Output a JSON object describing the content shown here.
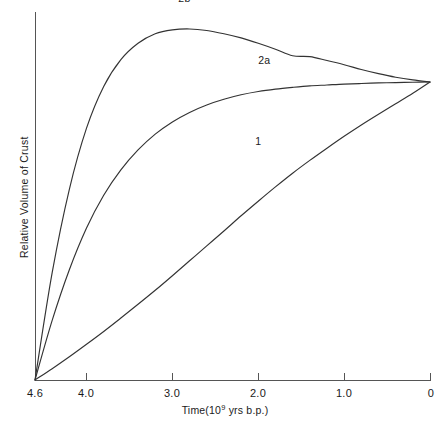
{
  "chart_data": {
    "type": "line",
    "title": "",
    "xlabel": "Time(10⁹ yrs b.p.)",
    "xlabel_parts": {
      "prefix": "Time(10",
      "exponent": "9",
      "suffix": " yrs b.p.)"
    },
    "ylabel": "Relative Volume of Crust",
    "xlim": [
      4.6,
      0.0
    ],
    "ylim": [
      0,
      1.05
    ],
    "x_axis_reversed": true,
    "xticks": [
      4.6,
      4.0,
      3.0,
      2.0,
      1.0,
      0
    ],
    "xticklabels": [
      "4.6",
      "4.0",
      "3.0",
      "2.0",
      "1.0",
      "0"
    ],
    "yticks": [],
    "yticklabels": [],
    "grid": false,
    "legend": "inline-curve-labels",
    "series": [
      {
        "name": "1",
        "label": "1",
        "label_x": 2.0,
        "label_y": 0.79,
        "x": [
          4.6,
          4.4,
          4.2,
          4.0,
          3.8,
          3.6,
          3.4,
          3.2,
          3.0,
          2.8,
          2.6,
          2.4,
          2.2,
          2.0,
          1.8,
          1.6,
          1.4,
          1.2,
          1.0,
          0.8,
          0.6,
          0.4,
          0.2,
          0.0
        ],
        "y": [
          0.0,
          0.038,
          0.078,
          0.12,
          0.163,
          0.208,
          0.254,
          0.301,
          0.35,
          0.4,
          0.45,
          0.5,
          0.551,
          0.6,
          0.648,
          0.694,
          0.737,
          0.778,
          0.818,
          0.856,
          0.892,
          0.927,
          0.962,
          1.0
        ]
      },
      {
        "name": "2a",
        "label": "2a",
        "label_x": 1.93,
        "label_y": 1.06,
        "x": [
          4.6,
          4.4,
          4.2,
          4.0,
          3.8,
          3.6,
          3.4,
          3.2,
          3.0,
          2.8,
          2.6,
          2.4,
          2.2,
          2.0,
          1.8,
          1.6,
          1.4,
          1.2,
          1.0,
          0.8,
          0.6,
          0.4,
          0.2,
          0.0
        ],
        "y": [
          0.0,
          0.2,
          0.37,
          0.51,
          0.62,
          0.705,
          0.772,
          0.825,
          0.866,
          0.898,
          0.923,
          0.942,
          0.957,
          0.968,
          0.976,
          0.982,
          0.987,
          0.99,
          0.993,
          0.995,
          0.997,
          0.998,
          0.999,
          1.0
        ]
      },
      {
        "name": "2b",
        "label": "2b",
        "label_x": 2.86,
        "label_y": 1.27,
        "x": [
          4.6,
          4.4,
          4.2,
          4.0,
          3.8,
          3.6,
          3.4,
          3.2,
          3.0,
          2.8,
          2.6,
          2.4,
          2.2,
          2.0,
          1.8,
          1.6,
          1.4,
          1.2,
          1.0,
          0.8,
          0.6,
          0.4,
          0.2,
          0.0
        ],
        "y": [
          0.0,
          0.36,
          0.64,
          0.845,
          0.985,
          1.075,
          1.13,
          1.162,
          1.175,
          1.178,
          1.173,
          1.162,
          1.148,
          1.13,
          1.11,
          1.088,
          1.085,
          1.072,
          1.058,
          1.042,
          1.028,
          1.016,
          1.007,
          1.0
        ]
      }
    ],
    "annotations": [],
    "style": {
      "line_color": "#333333",
      "axis_color": "#555555",
      "background": "#ffffff",
      "text_color": "#1a1a1a"
    }
  }
}
